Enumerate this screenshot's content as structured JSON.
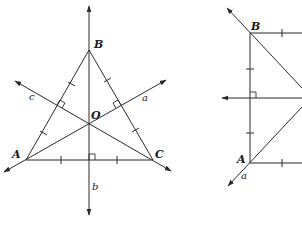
{
  "diagram_left": {
    "title": "Perpendicular bisectors of triangle ABC meeting at circumcenter O",
    "points": {
      "A": {
        "label": "A",
        "x": 26,
        "y": 160
      },
      "B": {
        "label": "B",
        "x": 89,
        "y": 50
      },
      "C": {
        "label": "C",
        "x": 153,
        "y": 160
      },
      "O": {
        "label": "O",
        "x": 89,
        "y": 123
      }
    },
    "lines": {
      "a": {
        "label": "a"
      },
      "b": {
        "label": "b"
      },
      "c": {
        "label": "c"
      }
    }
  },
  "diagram_right": {
    "title": "Partial triangle with vertices A and B",
    "points": {
      "A": {
        "label": "A",
        "x": 250,
        "y": 163
      },
      "B": {
        "label": "B",
        "x": 250,
        "y": 33
      }
    },
    "lines": {
      "a": {
        "label": "a"
      }
    }
  },
  "colors": {
    "stroke": "#2a2a2a",
    "background": "#ffffff"
  }
}
